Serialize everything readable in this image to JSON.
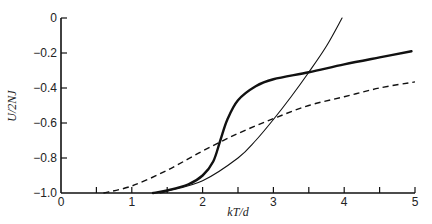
{
  "chart_data": {
    "type": "line",
    "title": "",
    "xlabel": "kT/d",
    "ylabel": "U/2NJ",
    "xlim": [
      0,
      5
    ],
    "ylim": [
      -1.0,
      0
    ],
    "grid": false,
    "legend": null,
    "x_ticks": [
      0,
      0.5,
      1,
      1.5,
      2,
      2.5,
      3,
      3.5,
      4,
      4.5,
      5
    ],
    "x_tick_labels": [
      "0",
      "",
      "1",
      "",
      "2",
      "",
      "3",
      "",
      "4",
      "",
      "5"
    ],
    "y_ticks": [
      0,
      -0.2,
      -0.4,
      -0.6,
      -0.8,
      -1.0
    ],
    "y_tick_labels": [
      "0",
      "-0.2",
      "-0.4",
      "-0.6",
      "-0.8",
      "-1.0"
    ],
    "series": [
      {
        "name": "thick-solid",
        "style": "solid",
        "width": 2.4,
        "points": [
          [
            1.3,
            -1.0
          ],
          [
            1.5,
            -0.985
          ],
          [
            1.8,
            -0.95
          ],
          [
            2.0,
            -0.9
          ],
          [
            2.15,
            -0.82
          ],
          [
            2.25,
            -0.7
          ],
          [
            2.35,
            -0.58
          ],
          [
            2.5,
            -0.47
          ],
          [
            2.75,
            -0.39
          ],
          [
            3.0,
            -0.35
          ],
          [
            3.5,
            -0.31
          ],
          [
            4.0,
            -0.265
          ],
          [
            4.5,
            -0.225
          ],
          [
            4.95,
            -0.19
          ]
        ]
      },
      {
        "name": "thin-solid",
        "style": "solid",
        "width": 1.1,
        "points": [
          [
            1.4,
            -1.0
          ],
          [
            1.5,
            -0.99
          ],
          [
            2.0,
            -0.93
          ],
          [
            2.5,
            -0.8
          ],
          [
            2.75,
            -0.7
          ],
          [
            3.0,
            -0.58
          ],
          [
            3.25,
            -0.45
          ],
          [
            3.5,
            -0.31
          ],
          [
            3.75,
            -0.16
          ],
          [
            3.97,
            0.0
          ]
        ]
      },
      {
        "name": "dashed",
        "style": "dashed",
        "width": 1.4,
        "points": [
          [
            0.6,
            -1.0
          ],
          [
            1.0,
            -0.96
          ],
          [
            1.5,
            -0.87
          ],
          [
            2.0,
            -0.76
          ],
          [
            2.5,
            -0.66
          ],
          [
            3.0,
            -0.575
          ],
          [
            3.5,
            -0.5
          ],
          [
            4.0,
            -0.45
          ],
          [
            4.5,
            -0.4
          ],
          [
            5.0,
            -0.365
          ]
        ]
      }
    ]
  }
}
